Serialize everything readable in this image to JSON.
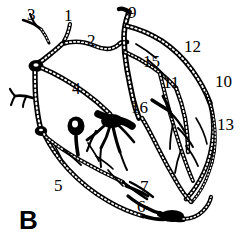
{
  "figure": {
    "panel_letter": "B",
    "panel_letter_position": {
      "x": 19,
      "y": 207
    },
    "background_color": "#ffffff",
    "ink_color": "#000000",
    "width": 242,
    "height": 245
  },
  "labels": [
    {
      "id": "label-3",
      "text": "3",
      "x": 27,
      "y": 6
    },
    {
      "id": "label-1",
      "text": "1",
      "x": 64,
      "y": 7
    },
    {
      "id": "label-9",
      "text": "9",
      "x": 128,
      "y": 4
    },
    {
      "id": "label-2",
      "text": "2",
      "x": 87,
      "y": 32
    },
    {
      "id": "label-12",
      "text": "12",
      "x": 184,
      "y": 38
    },
    {
      "id": "label-15",
      "text": "15",
      "x": 143,
      "y": 53
    },
    {
      "id": "label-11",
      "text": "11",
      "x": 163,
      "y": 74
    },
    {
      "id": "label-10",
      "text": "10",
      "x": 215,
      "y": 73
    },
    {
      "id": "label-4",
      "text": "4",
      "x": 72,
      "y": 80
    },
    {
      "id": "label-16",
      "text": "16",
      "x": 131,
      "y": 99
    },
    {
      "id": "label-13",
      "text": "13",
      "x": 217,
      "y": 116
    },
    {
      "id": "label-5",
      "text": "5",
      "x": 54,
      "y": 177
    },
    {
      "id": "label-7",
      "text": "7",
      "x": 140,
      "y": 178
    },
    {
      "id": "label-6",
      "text": "6",
      "x": 137,
      "y": 198
    }
  ]
}
